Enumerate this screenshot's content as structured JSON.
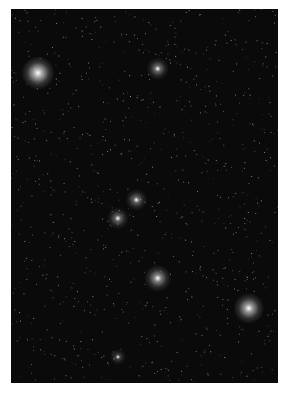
{
  "image": {
    "subject": "Orion constellation starfield photograph",
    "caption": "Night sky star field"
  },
  "stars": [
    {
      "name": "bright-star-top-left",
      "x": 0.1,
      "y": 0.17,
      "glow": 1.0
    },
    {
      "name": "star-top-center",
      "x": 0.55,
      "y": 0.16,
      "glow": 0.6
    },
    {
      "name": "belt-star-upper",
      "x": 0.47,
      "y": 0.51,
      "glow": 0.55
    },
    {
      "name": "belt-star-lower",
      "x": 0.4,
      "y": 0.56,
      "glow": 0.55
    },
    {
      "name": "nebula-core",
      "x": 0.55,
      "y": 0.72,
      "glow": 0.75
    },
    {
      "name": "bright-star-bottom-right",
      "x": 0.89,
      "y": 0.8,
      "glow": 0.9
    },
    {
      "name": "star-bottom",
      "x": 0.4,
      "y": 0.93,
      "glow": 0.35
    }
  ]
}
